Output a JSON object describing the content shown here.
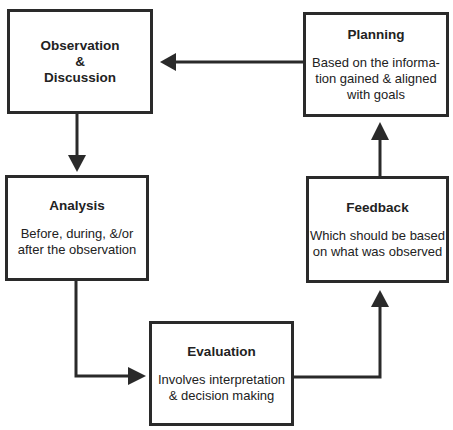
{
  "diagram": {
    "type": "cycle-flowchart",
    "nodes": [
      {
        "id": "observation",
        "title": "Observation\n&\nDiscussion",
        "description": ""
      },
      {
        "id": "analysis",
        "title": "Analysis",
        "description": "Before, during, &/or\nafter the observation"
      },
      {
        "id": "evaluation",
        "title": "Evaluation",
        "description": "Involves interpretation\n& decision making"
      },
      {
        "id": "feedback",
        "title": "Feedback",
        "description": "Which should be based\non what was observed"
      },
      {
        "id": "planning",
        "title": "Planning",
        "description": "Based on the informa-\ntion gained & aligned\nwith goals"
      }
    ],
    "edges": [
      {
        "from": "observation",
        "to": "analysis"
      },
      {
        "from": "analysis",
        "to": "evaluation"
      },
      {
        "from": "evaluation",
        "to": "feedback"
      },
      {
        "from": "feedback",
        "to": "planning"
      },
      {
        "from": "planning",
        "to": "observation"
      }
    ],
    "colors": {
      "stroke": "#2a2a2a",
      "background": "#ffffff",
      "text": "#222222"
    }
  }
}
